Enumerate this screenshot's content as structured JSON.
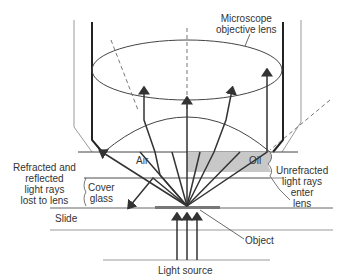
{
  "diagram": {
    "type": "optics-cross-section",
    "labels": {
      "objective_lens_line1": "Microscope",
      "objective_lens_line2": "objective lens",
      "air": "Air",
      "oil": "Oil",
      "refracted_line1": "Refracted and",
      "refracted_line2": "reflected",
      "refracted_line3": "light rays",
      "refracted_line4": "lost to lens",
      "cover_line1": "Cover",
      "cover_line2": "glass",
      "unrefracted_line1": "Unrefracted",
      "unrefracted_line2": "light rays",
      "unrefracted_line3": "enter",
      "unrefracted_line4": "lens",
      "slide": "Slide",
      "object": "Object",
      "light_source": "Light source"
    },
    "colors": {
      "line": "#333333",
      "oil_fill": "#c8c8c8",
      "slide_line": "#999999",
      "object_fill": "#777777"
    }
  }
}
